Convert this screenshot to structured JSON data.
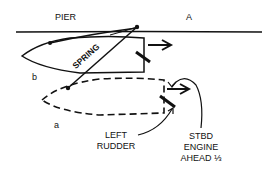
{
  "labels": {
    "pier": "PIER",
    "point_a": "A",
    "spring": "SPRING",
    "position_b": "b",
    "position_a": "a",
    "left_rudder_line1": "LEFT",
    "left_rudder_line2": "RUDDER",
    "engine_line1": "STBD",
    "engine_line2": "ENGINE",
    "engine_line3": "AHEAD ⅓"
  },
  "colors": {
    "ink": "#111111",
    "background": "#ffffff"
  }
}
